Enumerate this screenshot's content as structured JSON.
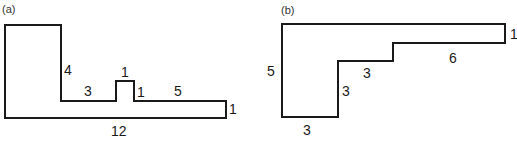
{
  "figures": [
    {
      "id": "a",
      "panel_label": "(a)",
      "dimensions": {
        "left_step_height": "4",
        "lower_ledge_left": "3",
        "bump_width": "1",
        "bump_height": "1",
        "lower_ledge_right": "5",
        "right_height": "1",
        "bottom_width": "12"
      }
    },
    {
      "id": "b",
      "panel_label": "(b)",
      "dimensions": {
        "left_height": "5",
        "bottom_width": "3",
        "first_riser": "3",
        "middle_tread": "3",
        "upper_tread": "6",
        "right_height": "1"
      }
    }
  ],
  "colors": {
    "stroke": "#1a1a1a",
    "background": "#ffffff"
  }
}
